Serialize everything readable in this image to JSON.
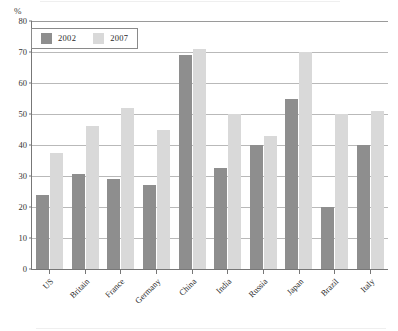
{
  "chart_data": {
    "type": "bar",
    "title": "",
    "subtitle": "",
    "xlabel": "",
    "ylabel": "%",
    "ylim": [
      0,
      80
    ],
    "ytick_step": 10,
    "yticks": [
      0,
      10,
      20,
      30,
      40,
      50,
      60,
      70,
      80
    ],
    "grid": true,
    "legend_position": "top-left",
    "categories": [
      "US",
      "Britain",
      "France",
      "Germany",
      "China",
      "India",
      "Russia",
      "Japan",
      "Brazil",
      "Italy"
    ],
    "series": [
      {
        "name": "2002",
        "color": "#8e8e8e",
        "values": [
          24,
          30.5,
          29,
          27,
          69,
          32.5,
          40,
          55,
          20,
          40
        ]
      },
      {
        "name": "2007",
        "color": "#d9d9d9",
        "values": [
          37.5,
          46,
          52,
          45,
          71,
          50,
          43,
          70,
          50,
          51
        ]
      }
    ]
  },
  "axis": {
    "unit_label": "%"
  }
}
